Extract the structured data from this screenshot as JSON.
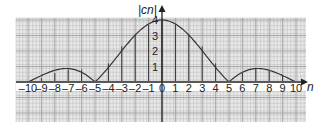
{
  "chart_data": {
    "type": "bar",
    "subtype": "line-spectrum (stem) with envelope curve",
    "title": "",
    "xlabel": "n",
    "ylabel": "|cn|",
    "xlim": [
      -10,
      10
    ],
    "ylim": [
      0,
      4
    ],
    "grid": true,
    "legend": null,
    "x_ticks": [
      "-10",
      "-9",
      "-8",
      "-7",
      "-6",
      "-5",
      "-4",
      "-3",
      "-2",
      "-1",
      "0",
      "1",
      "2",
      "3",
      "4",
      "5",
      "6",
      "7",
      "8",
      "9",
      "10"
    ],
    "y_ticks": [
      "1",
      "2",
      "3",
      "4"
    ],
    "categories": [
      -10,
      -9,
      -8,
      -7,
      -6,
      -5,
      -4,
      -3,
      -2,
      -1,
      0,
      1,
      2,
      3,
      4,
      5,
      6,
      7,
      8,
      9,
      10
    ],
    "values": [
      0.0,
      0.25,
      0.58,
      0.8,
      0.8,
      0.0,
      1.2,
      2.3,
      3.1,
      3.7,
      4.0,
      3.7,
      3.1,
      2.3,
      1.2,
      0.0,
      0.6,
      0.85,
      0.75,
      0.4,
      0.0
    ],
    "envelope": "|sinc|-shaped curve peaking at 4 at n=0, zeros at n=±5 and n=±10, side lobes peaking ~0.9 near n=±7.5"
  },
  "labels": {
    "y_axis": "|cn|",
    "x_axis": "n"
  },
  "colors": {
    "grid": "#b8b8b8",
    "axis": "#222222",
    "curve": "#333333",
    "background": "#e9e9e9"
  }
}
